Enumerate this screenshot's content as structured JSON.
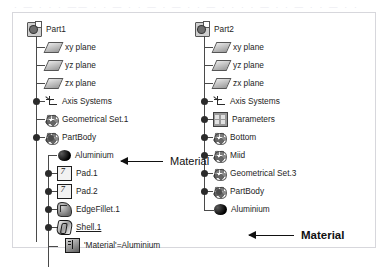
{
  "top_strip": {
    "text": "· — · ·  · —— · · — ·  · — ·  — · ·  — · ·  · · — · · — ·  · — · ·"
  },
  "panel": {
    "border_color": "#d7d7dc",
    "background": "#ffffff"
  },
  "trees": [
    {
      "id": "tree-left",
      "root": {
        "label": "Part1",
        "icon": "part-icon"
      },
      "nodes": [
        {
          "label": "xy plane",
          "icon": "plane-icon",
          "indent": 1,
          "connector": "stub",
          "knob": false,
          "underline": false
        },
        {
          "label": "yz plane",
          "icon": "plane-icon",
          "indent": 1,
          "connector": "stub",
          "knob": false,
          "underline": false
        },
        {
          "label": "zx plane",
          "icon": "plane-icon",
          "indent": 1,
          "connector": "stub",
          "knob": false,
          "underline": false
        },
        {
          "label": "Axis Systems",
          "icon": "axis-icon",
          "indent": 1,
          "connector": "stub",
          "knob": true,
          "underline": false
        },
        {
          "label": "Geometrical Set.1",
          "icon": "geoset-icon",
          "indent": 1,
          "connector": "stub",
          "knob": false,
          "underline": false
        },
        {
          "label": "PartBody",
          "icon": "partbody-icon",
          "indent": 1,
          "connector": "stub",
          "knob": true,
          "underline": false
        },
        {
          "label": "Aluminium",
          "icon": "material-icon",
          "indent": 2,
          "connector": "stub2",
          "knob": false,
          "underline": false
        },
        {
          "label": "Pad.1",
          "icon": "pad-icon",
          "indent": 2,
          "connector": "stub2",
          "knob": true,
          "underline": false
        },
        {
          "label": "Pad.2",
          "icon": "pad-icon",
          "indent": 2,
          "connector": "stub2",
          "knob": true,
          "underline": false
        },
        {
          "label": "EdgeFillet.1",
          "icon": "fillet-icon",
          "indent": 2,
          "connector": "stub2",
          "knob": true,
          "underline": false
        },
        {
          "label": "Shell.1",
          "icon": "shell-icon",
          "indent": 2,
          "connector": "stub2",
          "knob": true,
          "underline": true
        },
        {
          "label": "'Material'=Aluminium",
          "icon": "cube-icon",
          "indent": 2,
          "connector": "elbow2",
          "knob": false,
          "underline": false
        }
      ]
    },
    {
      "id": "tree-right",
      "root": {
        "label": "Part2",
        "icon": "part-icon"
      },
      "nodes": [
        {
          "label": "xy plane",
          "icon": "plane-icon",
          "indent": 1,
          "connector": "stub",
          "knob": false,
          "underline": false
        },
        {
          "label": "yz plane",
          "icon": "plane-icon",
          "indent": 1,
          "connector": "stub",
          "knob": false,
          "underline": false
        },
        {
          "label": "zx plane",
          "icon": "plane-icon",
          "indent": 1,
          "connector": "stub",
          "knob": false,
          "underline": false
        },
        {
          "label": "Axis Systems",
          "icon": "axis-icon",
          "indent": 1,
          "connector": "stub",
          "knob": true,
          "underline": false
        },
        {
          "label": "Parameters",
          "icon": "param-icon",
          "indent": 1,
          "connector": "stub",
          "knob": true,
          "underline": false
        },
        {
          "label": "Bottom",
          "icon": "geoset-icon",
          "indent": 1,
          "connector": "stub",
          "knob": true,
          "underline": false
        },
        {
          "label": "Miid",
          "icon": "geoset-icon",
          "indent": 1,
          "connector": "stub",
          "knob": true,
          "underline": false
        },
        {
          "label": "Geometrical Set.3",
          "icon": "geoset-icon",
          "indent": 1,
          "connector": "stub",
          "knob": true,
          "underline": false
        },
        {
          "label": "PartBody",
          "icon": "partbody-icon",
          "indent": 1,
          "connector": "stub",
          "knob": true,
          "underline": false
        },
        {
          "label": "Aluminium",
          "icon": "material-icon",
          "indent": 1,
          "connector": "elbow",
          "knob": false,
          "underline": false
        }
      ]
    }
  ],
  "annotations": [
    {
      "id": "annot-left",
      "text": "Material",
      "bold": false
    },
    {
      "id": "annot-right",
      "text": "Material",
      "bold": true
    }
  ]
}
